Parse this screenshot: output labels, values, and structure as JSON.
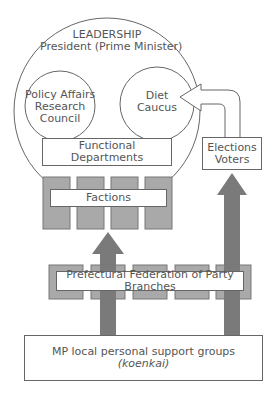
{
  "diagram": {
    "leadership": {
      "title": "LEADERSHIP",
      "subtitle": "President (Prime Minister)"
    },
    "policy_council": {
      "line1": "Policy Affairs",
      "line2": "Research",
      "line3": "Council"
    },
    "diet_caucus": {
      "line1": "Diet",
      "line2": "Caucus"
    },
    "functional_departments": "Functional Departments",
    "elections": {
      "line1": "Elections",
      "line2": "Voters"
    },
    "factions": "Factions",
    "prefectural": "Prefectural Federation of Party Branches",
    "support_groups": {
      "line1": "MP local personal support groups",
      "line2": "(koenkai)"
    },
    "colors": {
      "line": "#666666",
      "bar_fill": "#a9a9a9",
      "arrow_fill": "#7a7a7a",
      "text": "#555555"
    }
  }
}
